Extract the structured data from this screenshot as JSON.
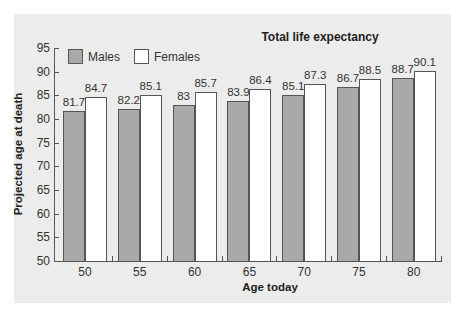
{
  "chart_data": {
    "type": "bar",
    "title": "Total life expectancy",
    "xlabel": "Age today",
    "ylabel": "Projected age at death",
    "categories": [
      "50",
      "55",
      "60",
      "65",
      "70",
      "75",
      "80"
    ],
    "series": [
      {
        "name": "Males",
        "color": "#a9a9a9",
        "values": [
          81.7,
          82.2,
          83,
          83.9,
          85.1,
          86.7,
          88.7
        ]
      },
      {
        "name": "Females",
        "color": "#ffffff",
        "values": [
          84.7,
          85.1,
          85.7,
          86.4,
          87.3,
          88.5,
          90.1
        ]
      }
    ],
    "value_labels": {
      "Males": [
        "81.7",
        "82.2",
        "83",
        "83.9",
        "85.1",
        "86.7",
        "88.7"
      ],
      "Females": [
        "84.7",
        "85.1",
        "85.7",
        "86.4",
        "87.3",
        "88.5",
        "90.1"
      ]
    },
    "ylim": [
      50,
      95
    ],
    "yticks": [
      "50",
      "55",
      "60",
      "65",
      "70",
      "75",
      "80",
      "85",
      "90",
      "95"
    ],
    "grid": false,
    "legend_position": "top-left"
  },
  "legend": {
    "males": "Males",
    "females": "Females"
  }
}
